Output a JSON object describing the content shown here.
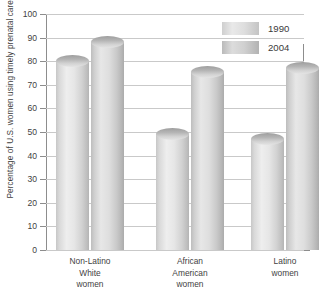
{
  "chart_data": {
    "type": "bar",
    "title": "",
    "xlabel": "",
    "ylabel": "Percentage of U.S. women using timely prenatal care",
    "ylim": [
      0,
      100
    ],
    "ytick_step": 10,
    "yticks": [
      "100",
      "90",
      "80",
      "70",
      "60",
      "50",
      "40",
      "30",
      "20",
      "10",
      "0"
    ],
    "grid": true,
    "legend_position": "top-right",
    "categories": [
      "Non-Latino White women",
      "African American women",
      "Latino women"
    ],
    "category_lines": [
      [
        "Non-Latino",
        "White",
        "women"
      ],
      [
        "African",
        "American",
        "women"
      ],
      [
        "Latino",
        "women"
      ]
    ],
    "series": [
      {
        "name": "1990",
        "values": [
          80,
          49,
          47
        ]
      },
      {
        "name": "2004",
        "values": [
          88,
          75.5,
          77
        ]
      }
    ],
    "colors": {
      "bar_1990": "#e0e0e0",
      "bar_2004": "#d4d4d4",
      "gridline": "#c9c9c9",
      "axis": "#8d8d8d",
      "text": "#3a3a3a"
    }
  },
  "legend": {
    "items": [
      {
        "label": "1990"
      },
      {
        "label": "2004"
      }
    ]
  }
}
